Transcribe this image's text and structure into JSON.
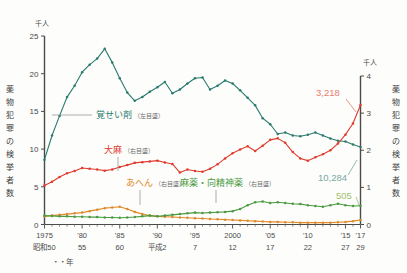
{
  "axes": {
    "left_unit": "千人",
    "right_unit": "千人",
    "left_title": "薬物犯罪の検挙者数",
    "right_title": "薬物犯罪の検挙者数",
    "left_ticks": [
      "25",
      "20",
      "15",
      "10",
      "5",
      "0"
    ],
    "right_ticks": [
      "4",
      "3",
      "2",
      "1",
      "0"
    ],
    "x_label_suffix": "・・年"
  },
  "x_ticks": [
    {
      "top": "1975",
      "bottom": "昭和50"
    },
    {
      "top": "'80",
      "bottom": "55"
    },
    {
      "top": "'85",
      "bottom": "60"
    },
    {
      "top": "'90",
      "bottom": "平成2"
    },
    {
      "top": "'95",
      "bottom": "7"
    },
    {
      "top": "2000",
      "bottom": "12"
    },
    {
      "top": "'05",
      "bottom": "17"
    },
    {
      "top": "'10",
      "bottom": "22"
    },
    {
      "top": "'15",
      "bottom": "27"
    },
    {
      "top": "'17",
      "bottom": "29"
    }
  ],
  "legends": [
    {
      "name": "覚せい剤",
      "scale": "（左目盛）",
      "color": "#2a7a6e"
    },
    {
      "name": "大麻",
      "scale": "（右目盛）",
      "color": "#e03b2f"
    },
    {
      "name": "あへん",
      "scale": "（右目盛）",
      "color": "#e08a2a"
    },
    {
      "name": "麻薬・向精神薬",
      "scale": "（右目盛）",
      "color": "#4a9a40"
    }
  ],
  "data_labels": [
    {
      "text": "3,218",
      "color": "#e87b70"
    },
    {
      "text": "10,284",
      "color": "#79a8a2"
    },
    {
      "text": "505",
      "color": "#9dbd6f"
    }
  ],
  "chart_data": {
    "type": "line",
    "title": "",
    "xlabel": "年",
    "ylabel": "薬物犯罪の検挙者数",
    "ylim": [
      0,
      25
    ],
    "y2lim": [
      0,
      4
    ],
    "y_unit": "千人",
    "y2_unit": "千人",
    "grid": false,
    "legend_position": "inline-annotations",
    "x": [
      1975,
      1976,
      1977,
      1978,
      1979,
      1980,
      1981,
      1982,
      1983,
      1984,
      1985,
      1986,
      1987,
      1988,
      1989,
      1990,
      1991,
      1992,
      1993,
      1994,
      1995,
      1996,
      1997,
      1998,
      1999,
      2000,
      2001,
      2002,
      2003,
      2004,
      2005,
      2006,
      2007,
      2008,
      2009,
      2010,
      2011,
      2012,
      2013,
      2014,
      2015,
      2016,
      2017
    ],
    "series": [
      {
        "name": "覚せい剤",
        "axis": "left",
        "unit": "千人",
        "color": "#2a7a6e",
        "values": [
          8.6,
          11.8,
          14.4,
          16.9,
          18.4,
          20.2,
          21.2,
          22.0,
          23.3,
          21.5,
          19.4,
          17.5,
          16.4,
          16.9,
          17.6,
          18.2,
          18.9,
          17.4,
          17.9,
          18.7,
          19.4,
          19.5,
          17.9,
          18.4,
          19.1,
          18.7,
          17.8,
          16.8,
          15.8,
          14.1,
          13.3,
          12.0,
          12.2,
          11.8,
          11.7,
          11.9,
          12.2,
          11.8,
          11.4,
          11.1,
          11.0,
          10.6,
          10.284
        ]
      },
      {
        "name": "大麻",
        "axis": "right",
        "unit": "千人",
        "color": "#e03b2f",
        "values": [
          1.05,
          1.15,
          1.28,
          1.38,
          1.44,
          1.52,
          1.5,
          1.48,
          1.45,
          1.48,
          1.55,
          1.6,
          1.66,
          1.68,
          1.7,
          1.72,
          1.67,
          1.63,
          1.4,
          1.48,
          1.44,
          1.42,
          1.5,
          1.62,
          1.78,
          1.92,
          2.02,
          2.11,
          1.98,
          2.12,
          2.28,
          2.32,
          2.2,
          1.95,
          1.78,
          1.72,
          1.81,
          1.89,
          2.0,
          2.18,
          2.42,
          2.72,
          3.218
        ]
      },
      {
        "name": "あへん",
        "axis": "right",
        "unit": "千人",
        "color": "#e08a2a",
        "values": [
          0.22,
          0.24,
          0.26,
          0.28,
          0.3,
          0.32,
          0.36,
          0.4,
          0.44,
          0.46,
          0.48,
          0.42,
          0.34,
          0.28,
          0.24,
          0.22,
          0.21,
          0.2,
          0.19,
          0.18,
          0.17,
          0.16,
          0.15,
          0.14,
          0.13,
          0.12,
          0.11,
          0.1,
          0.09,
          0.08,
          0.07,
          0.07,
          0.06,
          0.06,
          0.05,
          0.05,
          0.05,
          0.05,
          0.05,
          0.06,
          0.07,
          0.09,
          0.12
        ]
      },
      {
        "name": "麻薬・向精神薬",
        "axis": "right",
        "unit": "千人",
        "color": "#4a9a40",
        "values": [
          0.24,
          0.23,
          0.22,
          0.22,
          0.21,
          0.21,
          0.2,
          0.2,
          0.19,
          0.19,
          0.18,
          0.19,
          0.2,
          0.22,
          0.24,
          0.22,
          0.24,
          0.26,
          0.28,
          0.3,
          0.32,
          0.31,
          0.32,
          0.33,
          0.34,
          0.36,
          0.42,
          0.52,
          0.6,
          0.62,
          0.58,
          0.6,
          0.58,
          0.56,
          0.55,
          0.52,
          0.5,
          0.48,
          0.52,
          0.56,
          0.52,
          0.5,
          0.505
        ]
      }
    ]
  }
}
